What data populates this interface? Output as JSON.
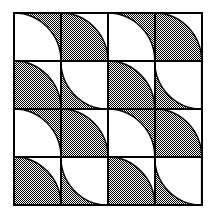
{
  "figure": {
    "type": "tiling-diagram",
    "background_color": "#ffffff",
    "line_color": "#000000",
    "fill_dark_color": "#808080",
    "fill_light_color": "#ffffff",
    "fill_pattern": "checkerboard-dither",
    "border_width": 2,
    "grid_line_width": 1.6
  },
  "grid": {
    "rows": 4,
    "cols": 4,
    "origin_x": 14,
    "origin_y": 13,
    "cell_width": 46.9,
    "cell_height": 48.0,
    "total_width": 187.5,
    "total_height": 192.0
  },
  "tiles": [
    {
      "row": 0,
      "col": 0,
      "base": "dark",
      "arc_corner": "bottom-left",
      "arc_fill": "light"
    },
    {
      "row": 0,
      "col": 1,
      "base": "light",
      "arc_corner": "bottom-left",
      "arc_fill": "dark"
    },
    {
      "row": 0,
      "col": 2,
      "base": "dark",
      "arc_corner": "bottom-left",
      "arc_fill": "light"
    },
    {
      "row": 0,
      "col": 3,
      "base": "light",
      "arc_corner": "bottom-left",
      "arc_fill": "dark"
    },
    {
      "row": 1,
      "col": 0,
      "base": "light",
      "arc_corner": "bottom-left",
      "arc_fill": "dark"
    },
    {
      "row": 1,
      "col": 1,
      "base": "dark",
      "arc_corner": "top-right",
      "arc_fill": "light"
    },
    {
      "row": 1,
      "col": 2,
      "base": "light",
      "arc_corner": "bottom-left",
      "arc_fill": "dark"
    },
    {
      "row": 1,
      "col": 3,
      "base": "dark",
      "arc_corner": "top-right",
      "arc_fill": "light"
    },
    {
      "row": 2,
      "col": 0,
      "base": "dark",
      "arc_corner": "bottom-left",
      "arc_fill": "light"
    },
    {
      "row": 2,
      "col": 1,
      "base": "light",
      "arc_corner": "bottom-left",
      "arc_fill": "dark"
    },
    {
      "row": 2,
      "col": 2,
      "base": "dark",
      "arc_corner": "bottom-left",
      "arc_fill": "light"
    },
    {
      "row": 2,
      "col": 3,
      "base": "light",
      "arc_corner": "bottom-left",
      "arc_fill": "dark"
    },
    {
      "row": 3,
      "col": 0,
      "base": "light",
      "arc_corner": "bottom-left",
      "arc_fill": "dark"
    },
    {
      "row": 3,
      "col": 1,
      "base": "dark",
      "arc_corner": "top-right",
      "arc_fill": "light"
    },
    {
      "row": 3,
      "col": 2,
      "base": "light",
      "arc_corner": "bottom-left",
      "arc_fill": "dark"
    },
    {
      "row": 3,
      "col": 3,
      "base": "dark",
      "arc_corner": "top-right",
      "arc_fill": "light"
    }
  ]
}
